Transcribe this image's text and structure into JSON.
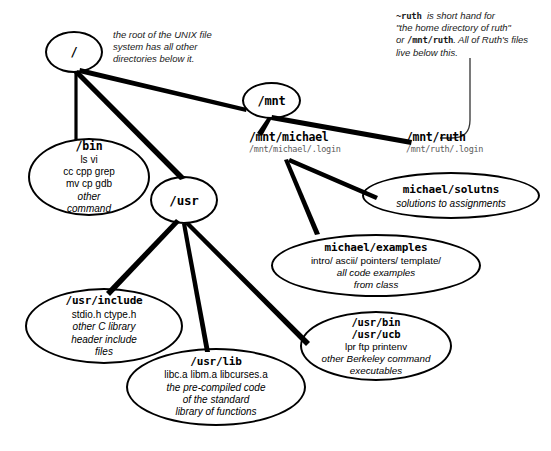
{
  "diagram": {
    "background": "#ffffff",
    "line_color": "#000000"
  },
  "annotations": {
    "root_note": {
      "line1": "the root of the UNIX file",
      "line2": "system has all other",
      "line3": "directories below it."
    },
    "ruth_note": {
      "mono1": "~ruth",
      "line1_rest": "is short hand for",
      "line2": "\"the home directory of ruth\"",
      "line3_pre": "or",
      "mono2": "/mnt/ruth",
      "line3_rest": ". All of Ruth's files",
      "line4": "live below this."
    }
  },
  "labels": {
    "mnt_michael": {
      "path": "/mnt/michael",
      "sub": "/mnt/michael/.login"
    },
    "mnt_ruth": {
      "path": "/mnt/ruth",
      "sub": "/mnt/ruth/.login"
    }
  },
  "nodes": [
    {
      "id": "root",
      "title": "/",
      "lines": []
    },
    {
      "id": "mnt",
      "title": "/mnt",
      "lines": []
    },
    {
      "id": "usr",
      "title": "/usr",
      "lines": []
    },
    {
      "id": "bin",
      "title": "/bin",
      "lines": [
        "ls      vi",
        "cc    cpp  grep",
        "mv   cp   gdb"
      ],
      "italic_lines": [
        "other",
        "command"
      ]
    },
    {
      "id": "solutns",
      "title": "michael/solutns",
      "italic_lines": [
        "solutions to assignments"
      ]
    },
    {
      "id": "examples",
      "title": "michael/examples",
      "lines": [
        "intro/    ascii/   pointers/   template/"
      ],
      "italic_lines": [
        "all code examples",
        "from class"
      ]
    },
    {
      "id": "include",
      "title": "/usr/include",
      "lines": [
        "stdio.h           ctype.h"
      ],
      "italic_lines": [
        "other C library",
        "header include",
        "files"
      ]
    },
    {
      "id": "usrbin",
      "title": "/usr/bin",
      "title2": "/usr/ucb",
      "lines": [
        "lpr ftp printenv"
      ],
      "italic_lines": [
        "other Berkeley command",
        "executables"
      ]
    },
    {
      "id": "usrlib",
      "title": "/usr/lib",
      "lines": [
        "libc.a  libm.a   libcurses.a"
      ],
      "italic_lines": [
        "the pre-compiled code",
        "of the standard",
        "library of functions"
      ]
    }
  ],
  "edges": [
    {
      "from": "root",
      "to": "bin"
    },
    {
      "from": "root",
      "to": "usr"
    },
    {
      "from": "root",
      "to": "mnt"
    },
    {
      "from": "mnt",
      "to": "mnt_michael"
    },
    {
      "from": "mnt",
      "to": "mnt_ruth"
    },
    {
      "from": "mnt_michael",
      "to": "solutns"
    },
    {
      "from": "mnt_michael",
      "to": "examples"
    },
    {
      "from": "usr",
      "to": "include"
    },
    {
      "from": "usr",
      "to": "usrlib"
    },
    {
      "from": "usr",
      "to": "usrbin"
    },
    {
      "from": "ruth_note",
      "to": "mnt_ruth",
      "style": "thin-curve"
    }
  ]
}
